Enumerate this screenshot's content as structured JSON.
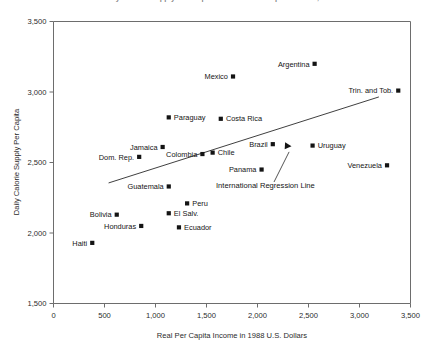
{
  "chart_data": {
    "type": "scatter",
    "title": "Daily Calorie Supply Per Capita and Real Per Capita Income, 1988",
    "xlabel": "Real Per Capita Income in 1988 U.S. Dollars",
    "ylabel": "Daily Calorie Supply Per Capita",
    "xlim": [
      0,
      3500
    ],
    "ylim": [
      1500,
      3500
    ],
    "xticks": [
      "0",
      "500",
      "1,000",
      "1,500",
      "2,000",
      "2,500",
      "3,000",
      "3,500"
    ],
    "xtick_values": [
      0,
      500,
      1000,
      1500,
      2000,
      2500,
      3000,
      3500
    ],
    "yticks": [
      "1,500",
      "2,000",
      "2,500",
      "3,000",
      "3,500"
    ],
    "ytick_values": [
      1500,
      2000,
      2500,
      3000,
      3500
    ],
    "grid": false,
    "legend": "none",
    "marker_shape": "square",
    "marker_color": "#141414",
    "points": [
      {
        "name": "Haiti",
        "x": 380,
        "y": 1930,
        "label_side": "left"
      },
      {
        "name": "Bolivia",
        "x": 620,
        "y": 2130,
        "label_side": "left"
      },
      {
        "name": "Honduras",
        "x": 860,
        "y": 2050,
        "label_side": "left"
      },
      {
        "name": "Dom. Rep.",
        "x": 840,
        "y": 2540,
        "label_side": "left"
      },
      {
        "name": "Jamaica",
        "x": 1070,
        "y": 2610,
        "label_side": "left"
      },
      {
        "name": "Guatemala",
        "x": 1130,
        "y": 2330,
        "label_side": "left"
      },
      {
        "name": "El Salv.",
        "x": 1130,
        "y": 2140,
        "label_side": "right"
      },
      {
        "name": "Paraguay",
        "x": 1130,
        "y": 2820,
        "label_side": "right"
      },
      {
        "name": "Ecuador",
        "x": 1230,
        "y": 2040,
        "label_side": "right"
      },
      {
        "name": "Peru",
        "x": 1310,
        "y": 2210,
        "label_side": "right"
      },
      {
        "name": "Colombia",
        "x": 1460,
        "y": 2560,
        "label_side": "left"
      },
      {
        "name": "Chile",
        "x": 1560,
        "y": 2570,
        "label_side": "right"
      },
      {
        "name": "Costa Rica",
        "x": 1640,
        "y": 2810,
        "label_side": "right"
      },
      {
        "name": "Mexico",
        "x": 1760,
        "y": 3110,
        "label_side": "left"
      },
      {
        "name": "Panama",
        "x": 2040,
        "y": 2450,
        "label_side": "left"
      },
      {
        "name": "Brazil",
        "x": 2150,
        "y": 2630,
        "label_side": "left"
      },
      {
        "name": "Uruguay",
        "x": 2540,
        "y": 2620,
        "label_side": "right"
      },
      {
        "name": "Argentina",
        "x": 2560,
        "y": 3200,
        "label_side": "left"
      },
      {
        "name": "Venezuela",
        "x": 3270,
        "y": 2480,
        "label_side": "left"
      },
      {
        "name": "Trin. and Tob.",
        "x": 3380,
        "y": 3010,
        "label_side": "left"
      }
    ],
    "regression_line": {
      "label": "International Regression Line",
      "x_start": 540,
      "y_start": 2355,
      "x_end": 3190,
      "y_end": 2965
    },
    "annotation": {
      "text": "International Regression Line",
      "arrow_target_x": 2300,
      "arrow_target_y": 2625
    }
  }
}
